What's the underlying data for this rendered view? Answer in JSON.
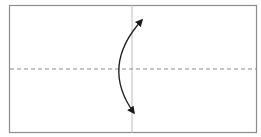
{
  "diagram": {
    "type": "origami-fold-step",
    "colors": {
      "paper_border": "#8c8c8c",
      "center_line": "#c8c8c8",
      "valley_fold_line": "#8c8c8c",
      "arrow": "#1a1a1a",
      "background": "#ffffff"
    },
    "paper": {
      "x": 9,
      "y": 5,
      "width": 247,
      "height": 127
    },
    "crease_vertical": {
      "x": 132
    },
    "valley_fold_horizontal": {
      "y": 69,
      "dash": "4 3"
    },
    "fold_arrow": {
      "start": {
        "x": 134,
        "y": 113
      },
      "control": {
        "x": 100,
        "y": 66
      },
      "end": {
        "x": 142,
        "y": 20
      },
      "bidirectional": true
    }
  }
}
